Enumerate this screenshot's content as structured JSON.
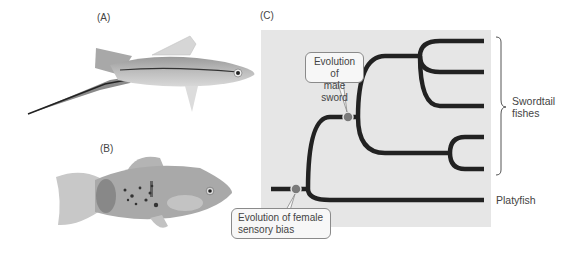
{
  "panels": {
    "a": {
      "label": "(A)",
      "subject": "swordtail-fish-photo"
    },
    "b": {
      "label": "(B)",
      "subject": "platyfish-photo"
    },
    "c": {
      "label": "(C)",
      "subject": "phylogenetic-tree"
    }
  },
  "tree": {
    "callouts": {
      "male_sword": {
        "line1": "Evolution of",
        "line2": "male sword"
      },
      "female_bias": {
        "line1": "Evolution of female",
        "line2": "sensory bias"
      }
    },
    "clade_label": {
      "line1": "Swordtail",
      "line2": "fishes"
    },
    "outgroup_label": "Platyfish",
    "leaves_count": 6,
    "colors": {
      "branch": "#222222",
      "panel_bg": "#e6e6e6",
      "marker": "#777777"
    }
  }
}
